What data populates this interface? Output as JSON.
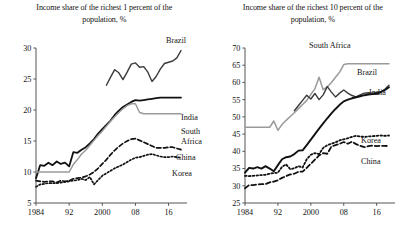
{
  "figure": {
    "name": "income-share-two-panel-figure"
  },
  "chart_data": [
    {
      "id": "left",
      "type": "line",
      "title": "Income share of the richest 1 percent of the population, %",
      "title_line1": "Income share of the richest 1 percent of the",
      "title_line2": "population, %",
      "xlabel": "",
      "ylabel": "",
      "xlim": [
        1984,
        2019
      ],
      "ylim": [
        5,
        30
      ],
      "yticks": [
        5,
        10,
        15,
        20,
        25,
        30
      ],
      "ytick_labels": [
        "5",
        "10",
        "15",
        "20",
        "25",
        "30"
      ],
      "xticks": [
        1984,
        1992,
        2000,
        2008,
        2016
      ],
      "xtick_labels": [
        "1984",
        "92",
        "2000",
        "08",
        "16"
      ],
      "grid": false,
      "legend": "inline-right-labels",
      "x": [
        1984,
        1985,
        1986,
        1987,
        1988,
        1989,
        1990,
        1991,
        1992,
        1993,
        1994,
        1995,
        1996,
        1997,
        1998,
        1999,
        2000,
        2001,
        2002,
        2003,
        2004,
        2005,
        2006,
        2007,
        2008,
        2009,
        2010,
        2011,
        2012,
        2013,
        2014,
        2015,
        2016,
        2017,
        2018,
        2019
      ],
      "series": [
        {
          "name": "Brazil",
          "color": "#3a3a3a",
          "style": "solid",
          "width": 1.4,
          "start_year": 2001,
          "values": [
            null,
            null,
            null,
            null,
            null,
            null,
            null,
            null,
            null,
            null,
            null,
            null,
            null,
            null,
            null,
            null,
            null,
            24.0,
            25.3,
            26.5,
            26.0,
            24.9,
            26.1,
            27.4,
            27.6,
            26.9,
            27.0,
            26.1,
            24.6,
            25.4,
            26.6,
            27.5,
            27.7,
            27.9,
            28.4,
            29.6
          ]
        },
        {
          "name": "India",
          "color": "#111111",
          "style": "solid",
          "width": 1.8,
          "values": [
            9.0,
            11.1,
            11.0,
            11.5,
            11.1,
            11.7,
            11.3,
            11.5,
            10.9,
            13.2,
            13.1,
            13.6,
            14.0,
            14.6,
            15.3,
            16.2,
            16.9,
            17.6,
            18.3,
            19.2,
            19.9,
            20.5,
            20.9,
            21.3,
            21.6,
            21.5,
            21.6,
            21.7,
            21.8,
            21.9,
            22.0,
            22.0,
            22.0,
            22.0,
            22.0,
            22.0
          ]
        },
        {
          "name": "South Africa",
          "color": "#9a9a9a",
          "style": "solid",
          "width": 1.5,
          "values": [
            10.0,
            10.0,
            10.0,
            10.0,
            10.0,
            10.0,
            10.0,
            10.0,
            10.0,
            11.2,
            12.0,
            12.9,
            13.5,
            14.3,
            15.1,
            15.9,
            16.6,
            17.4,
            18.2,
            18.9,
            19.6,
            20.2,
            20.7,
            21.0,
            21.0,
            19.6,
            19.4,
            19.4,
            19.4,
            19.4,
            19.4,
            19.4,
            19.4,
            19.4,
            19.4,
            19.4
          ]
        },
        {
          "name": "China",
          "color": "#111111",
          "style": "dashed",
          "width": 1.7,
          "values": [
            8.6,
            8.5,
            8.4,
            8.5,
            8.5,
            8.3,
            8.6,
            8.5,
            8.6,
            8.9,
            9.0,
            9.1,
            9.3,
            9.6,
            10.0,
            10.6,
            11.3,
            12.0,
            12.8,
            13.5,
            14.1,
            14.6,
            15.0,
            15.3,
            15.4,
            15.1,
            14.8,
            14.5,
            14.2,
            13.9,
            13.9,
            13.9,
            14.0,
            14.0,
            13.8,
            13.6
          ]
        },
        {
          "name": "Korea",
          "color": "#111111",
          "style": "dotted",
          "width": 1.7,
          "values": [
            7.6,
            8.0,
            8.1,
            8.2,
            8.2,
            8.2,
            8.3,
            8.4,
            8.5,
            8.6,
            8.7,
            8.9,
            8.7,
            9.2,
            8.0,
            8.7,
            9.4,
            9.8,
            10.2,
            10.6,
            10.9,
            11.2,
            11.6,
            12.0,
            12.3,
            12.4,
            12.6,
            12.8,
            12.9,
            12.7,
            12.5,
            12.4,
            12.4,
            12.5,
            12.4,
            12.3
          ]
        }
      ],
      "series_label_positions": [
        {
          "name": "Brazil",
          "label": "Brazil"
        },
        {
          "name": "India",
          "label": "India"
        },
        {
          "name": "South Africa",
          "label_line1": "South",
          "label_line2": "Africa"
        },
        {
          "name": "China",
          "label": "China"
        },
        {
          "name": "Korea",
          "label": "Korea"
        }
      ]
    },
    {
      "id": "right",
      "type": "line",
      "title": "Income share of the richest 10 percent of the population, %",
      "title_line1": "Income share of the richest 10 percent of the",
      "title_line2": "population, %",
      "xlabel": "",
      "ylabel": "",
      "xlim": [
        1984,
        2019
      ],
      "ylim": [
        25,
        70
      ],
      "yticks": [
        25,
        30,
        35,
        40,
        45,
        50,
        55,
        60,
        65,
        70
      ],
      "ytick_labels": [
        "25",
        "30",
        "35",
        "40",
        "45",
        "50",
        "55",
        "60",
        "65",
        "70"
      ],
      "xticks": [
        1984,
        1992,
        2000,
        2008,
        2016
      ],
      "xtick_labels": [
        "1984",
        "92",
        "2000",
        "08",
        "16"
      ],
      "grid": false,
      "legend": "inline-right-labels",
      "x": [
        1984,
        1985,
        1986,
        1987,
        1988,
        1989,
        1990,
        1991,
        1992,
        1993,
        1994,
        1995,
        1996,
        1997,
        1998,
        1999,
        2000,
        2001,
        2002,
        2003,
        2004,
        2005,
        2006,
        2007,
        2008,
        2009,
        2010,
        2011,
        2012,
        2013,
        2014,
        2015,
        2016,
        2017,
        2018,
        2019
      ],
      "series": [
        {
          "name": "South Africa",
          "color": "#9a9a9a",
          "style": "solid",
          "width": 1.5,
          "values": [
            47.0,
            47.0,
            47.0,
            47.0,
            47.0,
            47.0,
            47.0,
            48.8,
            46.1,
            47.8,
            49.0,
            50.1,
            51.2,
            52.4,
            53.6,
            54.8,
            56.5,
            58.2,
            61.5,
            57.9,
            58.7,
            60.0,
            61.5,
            63.0,
            65.2,
            65.4,
            65.4,
            65.4,
            65.4,
            65.4,
            65.4,
            65.4,
            65.4,
            65.4,
            65.4,
            65.4
          ]
        },
        {
          "name": "Brazil",
          "color": "#3a3a3a",
          "style": "solid",
          "width": 1.4,
          "start_year": 1996,
          "values": [
            null,
            null,
            null,
            null,
            null,
            null,
            null,
            null,
            null,
            null,
            null,
            null,
            51.8,
            53.3,
            54.8,
            56.3,
            55.2,
            56.8,
            55.0,
            56.4,
            58.8,
            57.2,
            55.8,
            56.9,
            57.8,
            56.9,
            56.2,
            55.8,
            56.4,
            56.9,
            57.0,
            56.9,
            57.1,
            57.3,
            58.0,
            59.2
          ]
        },
        {
          "name": "India",
          "color": "#111111",
          "style": "solid",
          "width": 1.9,
          "values": [
            33.8,
            35.2,
            35.0,
            35.4,
            35.0,
            35.7,
            35.0,
            34.2,
            36.0,
            37.7,
            38.3,
            38.5,
            39.2,
            40.2,
            40.3,
            41.8,
            43.4,
            45.0,
            46.6,
            48.1,
            49.6,
            51.0,
            52.3,
            53.5,
            54.5,
            55.0,
            55.4,
            55.7,
            56.0,
            56.3,
            56.5,
            56.6,
            56.7,
            57.2,
            57.8,
            58.6
          ]
        },
        {
          "name": "Korea",
          "color": "#111111",
          "style": "dotted",
          "width": 1.8,
          "values": [
            32.9,
            32.8,
            32.9,
            33.0,
            33.1,
            33.2,
            33.5,
            33.7,
            33.8,
            35.5,
            36.2,
            34.8,
            35.1,
            35.7,
            35.3,
            37.7,
            39.0,
            39.5,
            39.2,
            41.0,
            41.8,
            42.2,
            42.6,
            43.2,
            43.5,
            43.8,
            44.2,
            44.5,
            44.3,
            44.2,
            44.3,
            44.4,
            44.5,
            44.6,
            44.5,
            44.6
          ]
        },
        {
          "name": "China",
          "color": "#111111",
          "style": "dashed",
          "width": 1.8,
          "values": [
            29.3,
            30.2,
            30.2,
            30.4,
            30.5,
            30.5,
            31.0,
            31.2,
            31.6,
            32.3,
            32.8,
            33.3,
            33.5,
            34.1,
            34.1,
            35.2,
            36.4,
            37.6,
            38.8,
            39.5,
            39.3,
            41.4,
            41.8,
            42.2,
            42.7,
            42.2,
            42.8,
            42.1,
            41.6,
            41.2,
            41.5,
            41.7,
            41.5,
            41.6,
            41.6,
            41.5
          ]
        }
      ],
      "series_label_positions": [
        {
          "name": "South Africa",
          "label": "South Africa"
        },
        {
          "name": "Brazil",
          "label": "Brazil"
        },
        {
          "name": "India",
          "label": "India"
        },
        {
          "name": "Korea",
          "label": "Korea"
        },
        {
          "name": "China",
          "label": "China"
        }
      ]
    }
  ]
}
